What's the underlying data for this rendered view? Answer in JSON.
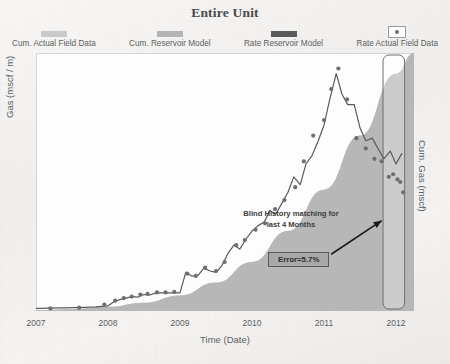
{
  "title": "Entire Unit",
  "legend": {
    "items": [
      {
        "label": "Cum. Actual Field Data",
        "swatch": "bar",
        "color": "#c9c9c9"
      },
      {
        "label": "Cum. Reservoir Model",
        "swatch": "bar",
        "color": "#b4b4b4"
      },
      {
        "label": "Rate Reservoir Model",
        "swatch": "bar",
        "color": "#5a5a5a"
      },
      {
        "label": "Rate Actual Field Data",
        "swatch": "marker-box",
        "color": "#6d6e71"
      }
    ]
  },
  "axes": {
    "ylabel_left": "Gas (mscf / m)",
    "ylabel_right": "Cum. Gas (mscf)",
    "xlabel": "Time (Date)"
  },
  "annotations": {
    "note": "Blind History matching for last 4 Months",
    "error_badge": "Error=5.7%",
    "highlight_region_label": "blind-history-window"
  },
  "chart_data": {
    "type": "line",
    "title": "Entire Unit",
    "xlabel": "Time (Date)",
    "ylabel": "Gas (mscf / m)",
    "ylabel_secondary": "Cum. Gas (mscf)",
    "xlim": [
      2007.0,
      2012.25
    ],
    "ylim": [
      0,
      100
    ],
    "ylim_secondary": [
      0,
      100
    ],
    "grid": false,
    "legend_position": "top",
    "xticks": [
      2007,
      2008,
      2009,
      2010,
      2011,
      2012
    ],
    "xtick_labels": [
      "2007",
      "2008",
      "2009",
      "2010",
      "2011",
      "2012"
    ],
    "highlight_span": [
      2011.82,
      2012.12
    ],
    "series": [
      {
        "name": "Rate Reservoir Model",
        "type": "line",
        "axis": "left",
        "color": "#5a5a5a",
        "x": [
          2007.0,
          2007.08,
          2007.17,
          2007.25,
          2007.33,
          2007.42,
          2007.5,
          2007.58,
          2007.67,
          2007.75,
          2007.83,
          2007.92,
          2008.0,
          2008.08,
          2008.17,
          2008.25,
          2008.33,
          2008.42,
          2008.5,
          2008.58,
          2008.67,
          2008.75,
          2008.83,
          2008.92,
          2009.0,
          2009.08,
          2009.17,
          2009.25,
          2009.33,
          2009.42,
          2009.5,
          2009.58,
          2009.67,
          2009.75,
          2009.83,
          2009.92,
          2010.0,
          2010.08,
          2010.17,
          2010.25,
          2010.33,
          2010.42,
          2010.5,
          2010.58,
          2010.67,
          2010.75,
          2010.83,
          2010.92,
          2011.0,
          2011.08,
          2011.17,
          2011.25,
          2011.33,
          2011.42,
          2011.5,
          2011.58,
          2011.67,
          2011.75,
          2011.83,
          2011.92,
          2012.0,
          2012.08
        ],
        "y": [
          1.0,
          1.0,
          1.1,
          1.1,
          1.2,
          1.2,
          1.3,
          1.3,
          1.4,
          1.5,
          1.6,
          1.8,
          2.0,
          3.5,
          4.5,
          5.0,
          5.6,
          5.4,
          6.4,
          6.2,
          7.0,
          7.0,
          7.0,
          7.0,
          7.0,
          15.0,
          13.5,
          13.8,
          16.5,
          15.5,
          15.0,
          17.5,
          22.5,
          25.5,
          24.0,
          28.0,
          31.0,
          33.0,
          34.5,
          39.0,
          37.5,
          42.0,
          46.0,
          52.0,
          49.0,
          57.0,
          60.0,
          66.0,
          72.0,
          82.0,
          92.0,
          84.0,
          80.0,
          80.0,
          71.0,
          66.0,
          67.0,
          63.0,
          59.0,
          62.0,
          57.0,
          61.0
        ]
      },
      {
        "name": "Rate Actual Field Data",
        "type": "scatter",
        "axis": "left",
        "color": "#6d6e71",
        "x": [
          2007.2,
          2007.6,
          2007.95,
          2008.1,
          2008.22,
          2008.33,
          2008.45,
          2008.55,
          2008.68,
          2008.8,
          2008.92,
          2009.1,
          2009.22,
          2009.35,
          2009.5,
          2009.62,
          2009.78,
          2009.9,
          2010.05,
          2010.18,
          2010.32,
          2010.45,
          2010.6,
          2010.72,
          2010.85,
          2011.0,
          2011.1,
          2011.2,
          2011.32,
          2011.45,
          2011.58,
          2011.7,
          2011.8,
          2011.9,
          2011.96,
          2012.02,
          2012.06,
          2012.1
        ],
        "y": [
          1.0,
          1.3,
          2.5,
          4.0,
          5.0,
          5.6,
          6.4,
          6.6,
          7.2,
          7.2,
          7.4,
          14.5,
          13.6,
          16.8,
          15.5,
          19.0,
          25.5,
          27.5,
          31.5,
          34.0,
          39.5,
          43.0,
          48.0,
          58.0,
          68.0,
          74.0,
          86.0,
          94.0,
          82.0,
          67.0,
          63.0,
          59.0,
          58.0,
          52.0,
          53.0,
          51.0,
          50.0,
          46.0
        ]
      },
      {
        "name": "Cum. Actual Field Data",
        "type": "area",
        "axis": "right",
        "color": "#c9c9c9",
        "x": [
          2007.0,
          2007.5,
          2008.0,
          2008.5,
          2009.0,
          2009.5,
          2010.0,
          2010.5,
          2011.0,
          2011.5,
          2012.0,
          2012.25
        ],
        "y": [
          0.3,
          0.7,
          1.6,
          3.2,
          6.0,
          11.0,
          19.0,
          31.0,
          47.0,
          68.0,
          92.0,
          100.0
        ]
      },
      {
        "name": "Cum. Reservoir Model",
        "type": "area",
        "axis": "right",
        "color": "#b4b4b4",
        "x": [
          2007.0,
          2007.5,
          2008.0,
          2008.5,
          2009.0,
          2009.5,
          2010.0,
          2010.5,
          2011.0,
          2011.5,
          2012.0,
          2012.25
        ],
        "y": [
          0.3,
          0.7,
          1.6,
          3.2,
          6.0,
          11.0,
          19.0,
          31.0,
          47.0,
          68.0,
          92.0,
          100.0
        ]
      }
    ],
    "annotations": [
      {
        "text": "Blind History matching for last 4 Months",
        "x": 2011.1,
        "y": 30
      },
      {
        "text": "Error=5.7%",
        "x": 2011.2,
        "y": 14
      }
    ]
  }
}
